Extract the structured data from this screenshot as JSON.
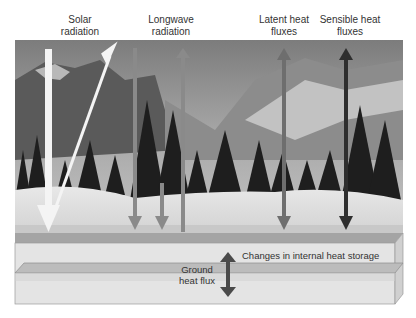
{
  "labels": {
    "solar": [
      "Solar",
      "radiation"
    ],
    "longwave": [
      "Longwave",
      "radiation"
    ],
    "latent": [
      "Latent heat",
      "fluxes"
    ],
    "sensible": [
      "Sensible heat",
      "fluxes"
    ]
  },
  "slab": {
    "storage_label": "Changes in internal heat storage",
    "ground_flux": [
      "Ground",
      "heat flux"
    ]
  },
  "scene": {
    "description": "Winter mountain landscape with snow-covered ground and evergreen trees"
  },
  "colors": {
    "solar_arrow": "#f4f4f4",
    "longwave_arrow": "#8a8a8a",
    "latent_arrow": "#6e6e6e",
    "sensible_arrow": "#2e2e2e",
    "ground_arrow": "#4a4a4a",
    "slab_face": "#e4e4e4",
    "slab_stripe": "#b8b8b8"
  }
}
